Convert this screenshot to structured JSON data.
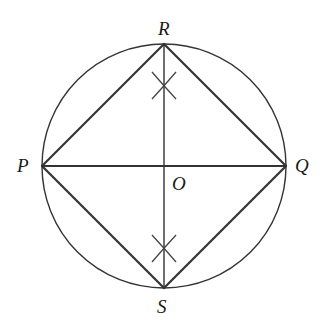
{
  "diagram": {
    "background": "#ffffff",
    "line_color": "#333333",
    "circle": {
      "center": [
        164,
        166
      ],
      "radius": 122
    },
    "points": {
      "P": {
        "label": "P",
        "x": 42,
        "y": 166
      },
      "Q": {
        "label": "Q",
        "x": 286,
        "y": 166
      },
      "R": {
        "label": "R",
        "x": 164,
        "y": 44
      },
      "S": {
        "label": "S",
        "x": 164,
        "y": 288
      },
      "O": {
        "label": "O",
        "x": 164,
        "y": 166
      }
    },
    "labels": {
      "P": "P",
      "Q": "Q",
      "R": "R",
      "S": "S",
      "O": "O"
    },
    "segments": [
      [
        "P",
        "R"
      ],
      [
        "R",
        "Q"
      ],
      [
        "Q",
        "S"
      ],
      [
        "S",
        "P"
      ],
      [
        "P",
        "Q"
      ],
      [
        "R",
        "S"
      ]
    ],
    "construction_marks": [
      {
        "name": "upper-arc-intersection",
        "x": 164,
        "y": 85
      },
      {
        "name": "lower-arc-intersection",
        "x": 164,
        "y": 249
      }
    ]
  }
}
